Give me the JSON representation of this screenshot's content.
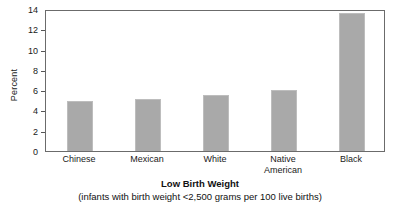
{
  "chart_data": {
    "type": "bar",
    "title": "Low Birth Weight",
    "subtitle": "(infants with birth weight <2,500 grams per 100 live births)",
    "xlabel": "",
    "ylabel": "Percent",
    "categories": [
      "Chinese",
      "Mexican",
      "White",
      "Native\nAmerican",
      "Black"
    ],
    "values": [
      4.9,
      5.1,
      5.5,
      6.0,
      13.6
    ],
    "ylim": [
      0,
      14
    ],
    "yticks": [
      0,
      2,
      4,
      6,
      8,
      10,
      12,
      14
    ],
    "ytick_labels": [
      "0",
      "2",
      "4",
      "6",
      "8",
      "10",
      "12",
      "14"
    ],
    "grid": false,
    "legend": null,
    "bar_color": "#a9a9a9",
    "frame_color": "#6b6b6b",
    "background_color": "#ffffff"
  }
}
